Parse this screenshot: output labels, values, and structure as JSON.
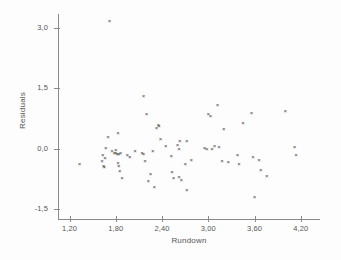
{
  "chart_data": {
    "type": "scatter",
    "title": "",
    "xlabel": "Rundown",
    "ylabel": "Residuals",
    "xlim": [
      1.05,
      4.45
    ],
    "ylim": [
      -1.75,
      3.35
    ],
    "grid": false,
    "legend": null,
    "marker": "x",
    "marker_color": "#3d3d3d",
    "axis_color": "#8a8a8a",
    "xticks": [
      1.2,
      1.8,
      2.4,
      3.0,
      3.6,
      4.2
    ],
    "xtick_labels": [
      "1,20",
      "1,80",
      "2,40",
      "3,00",
      "3,60",
      "4,20"
    ],
    "yticks": [
      3.0,
      1.5,
      0.0,
      -1.5
    ],
    "ytick_labels": [
      "3,0",
      "1,5",
      "0,0",
      "-1,5"
    ],
    "points": [
      {
        "x": 1.72,
        "y": 3.18
      },
      {
        "x": 1.33,
        "y": -0.38
      },
      {
        "x": 1.7,
        "y": 0.28
      },
      {
        "x": 1.83,
        "y": 0.4
      },
      {
        "x": 1.67,
        "y": 0.02
      },
      {
        "x": 1.75,
        "y": -0.05
      },
      {
        "x": 1.63,
        "y": -0.17
      },
      {
        "x": 1.66,
        "y": -0.22
      },
      {
        "x": 1.62,
        "y": -0.3
      },
      {
        "x": 1.64,
        "y": -0.43
      },
      {
        "x": 1.65,
        "y": -0.46
      },
      {
        "x": 1.78,
        "y": -0.12
      },
      {
        "x": 1.8,
        "y": -0.1
      },
      {
        "x": 1.82,
        "y": -0.13
      },
      {
        "x": 1.84,
        "y": -0.14
      },
      {
        "x": 1.86,
        "y": -0.11
      },
      {
        "x": 1.8,
        "y": -0.04
      },
      {
        "x": 1.83,
        "y": -0.35
      },
      {
        "x": 1.84,
        "y": -0.42
      },
      {
        "x": 1.85,
        "y": -0.56
      },
      {
        "x": 1.88,
        "y": -0.72
      },
      {
        "x": 1.95,
        "y": -0.15
      },
      {
        "x": 1.98,
        "y": -0.2
      },
      {
        "x": 2.05,
        "y": -0.07
      },
      {
        "x": 2.14,
        "y": -0.1
      },
      {
        "x": 2.16,
        "y": -0.14
      },
      {
        "x": 2.18,
        "y": -0.3
      },
      {
        "x": 2.16,
        "y": 1.32
      },
      {
        "x": 2.2,
        "y": 0.85
      },
      {
        "x": 2.28,
        "y": -0.06
      },
      {
        "x": 2.33,
        "y": 0.52
      },
      {
        "x": 2.36,
        "y": 0.56
      },
      {
        "x": 2.35,
        "y": 0.6
      },
      {
        "x": 2.38,
        "y": 0.25
      },
      {
        "x": 2.25,
        "y": -0.62
      },
      {
        "x": 2.22,
        "y": -0.8
      },
      {
        "x": 2.3,
        "y": -0.95
      },
      {
        "x": 2.45,
        "y": 0.06
      },
      {
        "x": 2.52,
        "y": -0.18
      },
      {
        "x": 2.53,
        "y": -0.58
      },
      {
        "x": 2.55,
        "y": -0.72
      },
      {
        "x": 2.6,
        "y": 0.1
      },
      {
        "x": 2.62,
        "y": 0.0
      },
      {
        "x": 2.63,
        "y": 0.2
      },
      {
        "x": 2.62,
        "y": -0.7
      },
      {
        "x": 2.65,
        "y": -0.78
      },
      {
        "x": 2.72,
        "y": 0.18
      },
      {
        "x": 2.7,
        "y": -0.38
      },
      {
        "x": 2.72,
        "y": -1.02
      },
      {
        "x": 2.78,
        "y": -0.28
      },
      {
        "x": 2.95,
        "y": 0.02
      },
      {
        "x": 2.98,
        "y": 0.0
      },
      {
        "x": 3.0,
        "y": 0.86
      },
      {
        "x": 3.03,
        "y": 0.82
      },
      {
        "x": 3.05,
        "y": -0.02
      },
      {
        "x": 3.08,
        "y": 0.06
      },
      {
        "x": 3.12,
        "y": 1.08
      },
      {
        "x": 3.14,
        "y": 0.04
      },
      {
        "x": 3.2,
        "y": 0.48
      },
      {
        "x": 3.18,
        "y": -0.3
      },
      {
        "x": 3.26,
        "y": -0.32
      },
      {
        "x": 3.38,
        "y": -0.15
      },
      {
        "x": 3.4,
        "y": -0.38
      },
      {
        "x": 3.45,
        "y": 0.65
      },
      {
        "x": 3.56,
        "y": 0.88
      },
      {
        "x": 3.58,
        "y": -0.2
      },
      {
        "x": 3.6,
        "y": -1.2
      },
      {
        "x": 3.66,
        "y": -0.28
      },
      {
        "x": 3.68,
        "y": -0.52
      },
      {
        "x": 3.76,
        "y": -0.68
      },
      {
        "x": 4.0,
        "y": 0.94
      },
      {
        "x": 4.12,
        "y": 0.04
      },
      {
        "x": 4.14,
        "y": -0.16
      }
    ]
  }
}
